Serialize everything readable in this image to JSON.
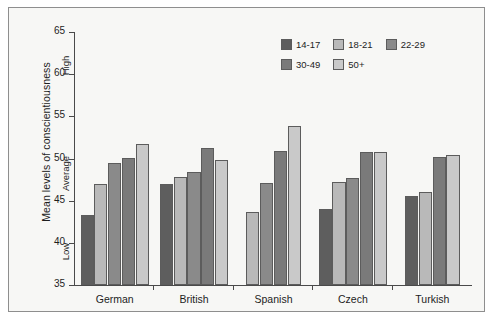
{
  "chart_data": {
    "type": "bar",
    "title": "",
    "subtitle": "",
    "xlabel": "",
    "ylabel": "Mean levels of conscientiousness",
    "ylim": [
      35,
      65
    ],
    "yticks": [
      35,
      40,
      45,
      50,
      55,
      60,
      65
    ],
    "ytick_labels": [
      "35",
      "40",
      "45",
      "50",
      "55",
      "60",
      "65"
    ],
    "grid": false,
    "legend_position": "top-right",
    "categories": [
      "German",
      "British",
      "Spanish",
      "Czech",
      "Turkish"
    ],
    "series": [
      {
        "name": "14-17",
        "color": "#5e5e5e",
        "values": [
          43.3,
          47.0,
          null,
          44.0,
          45.6
        ]
      },
      {
        "name": "18-21",
        "color": "#b9b9b9",
        "values": [
          47.0,
          47.8,
          43.6,
          47.2,
          46.0
        ]
      },
      {
        "name": "22-29",
        "color": "#8a8a8a",
        "values": [
          49.5,
          48.4,
          47.1,
          47.7,
          null
        ]
      },
      {
        "name": "30-49",
        "color": "#7a7a7a",
        "values": [
          50.1,
          51.2,
          50.9,
          50.8,
          50.2
        ]
      },
      {
        "name": "50+",
        "color": "#c9c9c9",
        "values": [
          51.7,
          49.8,
          53.9,
          50.8,
          50.4
        ]
      }
    ],
    "annotations": [
      {
        "text": "High",
        "axis": "y",
        "value": 61
      },
      {
        "text": "Average",
        "axis": "y",
        "value": 50
      },
      {
        "text": "Low",
        "axis": "y",
        "value": 40
      }
    ]
  },
  "axis": {
    "y_title": "Mean levels of conscientiousness",
    "band_high": "High",
    "band_average": "Average",
    "band_low": "Low"
  },
  "legend": {
    "row1": [
      {
        "label": "14-17"
      },
      {
        "label": "18-21"
      },
      {
        "label": "22-29"
      }
    ],
    "row2": [
      {
        "label": "30-49"
      },
      {
        "label": "50+"
      }
    ]
  },
  "colors": {
    "frame": "#8e8e8e",
    "plot_background": "#f7f7f5",
    "axis": "#4a4a4a",
    "bar_outline": "#5c5c5c",
    "text": "#1d1d1d"
  }
}
